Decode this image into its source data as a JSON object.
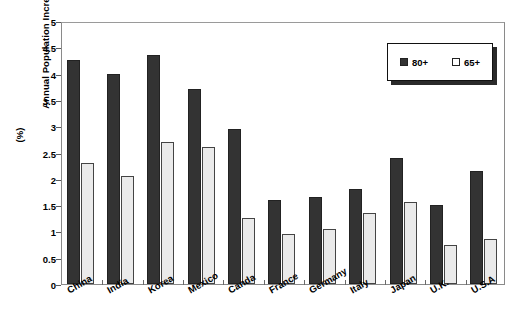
{
  "chart_data": {
    "type": "bar",
    "title": "",
    "xlabel": "",
    "ylabel": "Annual Population Increase (%)",
    "ylabel_line1": "Annual Population Increase",
    "ylabel_line2": "(%)",
    "ylim": [
      0,
      5
    ],
    "ytick_values": [
      0,
      0.5,
      1,
      1.5,
      2,
      2.5,
      3,
      3.5,
      4,
      4.5,
      5
    ],
    "ytick_labels": [
      "0",
      "0.5",
      "1",
      "1.5",
      "2",
      "2.5",
      "3",
      "3.5",
      "4",
      "4.5",
      "5"
    ],
    "grid": false,
    "legend_position": "upper-right",
    "categories": [
      "China",
      "India",
      "Korea",
      "Mexico",
      "Canda",
      "France",
      "Germany",
      "Italy",
      "Japan",
      "U.K.",
      "U.S.A"
    ],
    "series": [
      {
        "name": "80+",
        "color": "#333333",
        "values": [
          4.25,
          4.0,
          4.35,
          3.7,
          2.95,
          1.6,
          1.65,
          1.8,
          2.4,
          1.5,
          2.15
        ]
      },
      {
        "name": "65+",
        "color": "#eaeaea",
        "values": [
          2.3,
          2.05,
          2.7,
          2.6,
          1.25,
          0.95,
          1.05,
          1.35,
          1.55,
          0.75,
          0.85
        ]
      }
    ]
  },
  "legend": {
    "items": [
      {
        "label": "80+",
        "swatch": "dark-square-icon"
      },
      {
        "label": "65+",
        "swatch": "light-square-icon"
      }
    ]
  },
  "colors": {
    "series_80_plus": "#333333",
    "series_65_plus": "#eaeaea",
    "axis": "#8a8a8a",
    "text": "#000000",
    "background": "#ffffff"
  }
}
